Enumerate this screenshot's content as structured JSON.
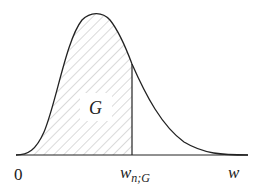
{
  "diagram": {
    "type": "probability-density-curve",
    "shaded_region_label": "G",
    "axis": {
      "origin_label": "0",
      "variable_label": "w",
      "quantile_label_main": "w",
      "quantile_label_sub": "n;G"
    },
    "colors": {
      "curve": "#222222",
      "hatch": "#b5b5b5",
      "background": "#ffffff"
    }
  }
}
